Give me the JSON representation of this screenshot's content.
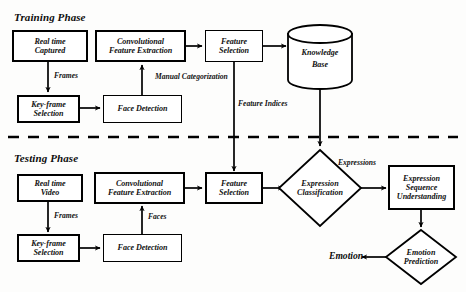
{
  "diagram": {
    "title_training": "Training Phase",
    "title_testing": "Testing Phase",
    "divider": "dashed-separator",
    "colors": {
      "stroke": "#000000",
      "fill": "#ffffff",
      "text": "#111111"
    }
  },
  "training": {
    "nodes": {
      "real_time_captured_l1": "Real time",
      "real_time_captured_l2": "Captured",
      "key_frame_l1": "Key-frame",
      "key_frame_l2": "Selection",
      "face_detection": "Face Detection",
      "conv_feature_l1": "Convolutional",
      "conv_feature_l2": "Feature Extraction",
      "feature_selection_l1": "Feature",
      "feature_selection_l2": "Selection",
      "knowledge_base_l1": "Knowledge",
      "knowledge_base_l2": "Base"
    },
    "edge_labels": {
      "frames": "Frames",
      "manual_categorization_l1": "Manual",
      "manual_categorization_l2": "Categorization",
      "feature_indices": "Feature Indices"
    }
  },
  "testing": {
    "nodes": {
      "real_time_video_l1": "Real time",
      "real_time_video_l2": "Video",
      "key_frame_l1": "Key-frame",
      "key_frame_l2": "Selection",
      "face_detection": "Face Detection",
      "conv_feature_l1": "Convolutional",
      "conv_feature_l2": "Feature Extraction",
      "feature_selection_l1": "Feature",
      "feature_selection_l2": "Selection",
      "expression_classification_l1": "Expression",
      "expression_classification_l2": "Classification",
      "expression_sequence_l1": "Expression",
      "expression_sequence_l2": "Sequence",
      "expression_sequence_l3": "Understanding",
      "emotion_prediction_l1": "Emotion",
      "emotion_prediction_l2": "Prediction"
    },
    "edge_labels": {
      "frames": "Frames",
      "faces": "Faces",
      "expressions": "Expressions"
    },
    "output": {
      "emotion": "Emotion"
    }
  }
}
